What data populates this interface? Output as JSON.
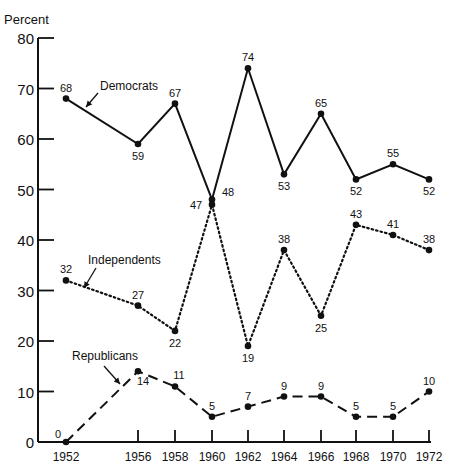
{
  "chart_data": {
    "type": "line",
    "title": "",
    "ylabel": "Percent",
    "xlabel": "",
    "ylim": [
      0,
      80
    ],
    "yticks": [
      0,
      10,
      20,
      30,
      40,
      50,
      60,
      70,
      80
    ],
    "x": [
      1952,
      1956,
      1958,
      1960,
      1962,
      1964,
      1966,
      1968,
      1970,
      1972
    ],
    "grid": false,
    "legend": "inline annotations with arrows",
    "series": [
      {
        "name": "Democrats",
        "style": "solid",
        "values": [
          68,
          59,
          67,
          48,
          74,
          53,
          65,
          52,
          55,
          52
        ]
      },
      {
        "name": "Independents",
        "style": "dotted",
        "values": [
          32,
          27,
          22,
          47,
          19,
          38,
          25,
          43,
          41,
          38
        ]
      },
      {
        "name": "Republicans",
        "style": "dashed",
        "values": [
          0,
          14,
          11,
          5,
          7,
          9,
          9,
          5,
          5,
          10
        ]
      }
    ]
  }
}
